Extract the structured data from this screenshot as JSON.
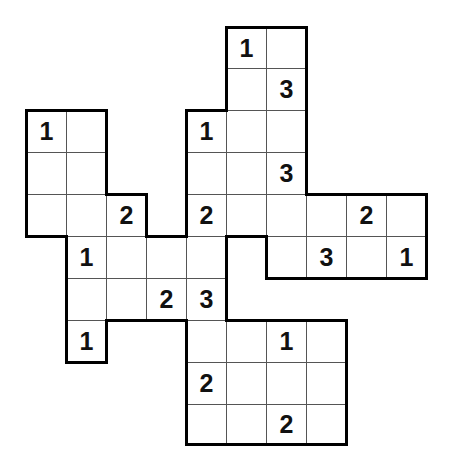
{
  "puzzle": {
    "type": "region-number-grid",
    "grid": {
      "origin_x": 26,
      "col_width": 40,
      "row_tops": [
        27,
        68,
        110,
        152,
        194,
        236,
        278,
        320,
        362,
        404,
        444
      ]
    },
    "cells": [
      {
        "r": 0,
        "c": 5,
        "v": "1"
      },
      {
        "r": 0,
        "c": 6,
        "v": ""
      },
      {
        "r": 1,
        "c": 5,
        "v": ""
      },
      {
        "r": 1,
        "c": 6,
        "v": "3"
      },
      {
        "r": 2,
        "c": 0,
        "v": "1"
      },
      {
        "r": 2,
        "c": 1,
        "v": ""
      },
      {
        "r": 2,
        "c": 4,
        "v": "1"
      },
      {
        "r": 2,
        "c": 5,
        "v": ""
      },
      {
        "r": 2,
        "c": 6,
        "v": ""
      },
      {
        "r": 3,
        "c": 0,
        "v": ""
      },
      {
        "r": 3,
        "c": 1,
        "v": ""
      },
      {
        "r": 3,
        "c": 4,
        "v": ""
      },
      {
        "r": 3,
        "c": 5,
        "v": ""
      },
      {
        "r": 3,
        "c": 6,
        "v": "3"
      },
      {
        "r": 4,
        "c": 0,
        "v": ""
      },
      {
        "r": 4,
        "c": 1,
        "v": ""
      },
      {
        "r": 4,
        "c": 2,
        "v": "2"
      },
      {
        "r": 4,
        "c": 4,
        "v": "2"
      },
      {
        "r": 4,
        "c": 5,
        "v": ""
      },
      {
        "r": 4,
        "c": 6,
        "v": ""
      },
      {
        "r": 4,
        "c": 7,
        "v": ""
      },
      {
        "r": 4,
        "c": 8,
        "v": "2"
      },
      {
        "r": 4,
        "c": 9,
        "v": ""
      },
      {
        "r": 5,
        "c": 1,
        "v": "1"
      },
      {
        "r": 5,
        "c": 2,
        "v": ""
      },
      {
        "r": 5,
        "c": 3,
        "v": ""
      },
      {
        "r": 5,
        "c": 4,
        "v": ""
      },
      {
        "r": 5,
        "c": 6,
        "v": ""
      },
      {
        "r": 5,
        "c": 7,
        "v": "3"
      },
      {
        "r": 5,
        "c": 8,
        "v": ""
      },
      {
        "r": 5,
        "c": 9,
        "v": "1"
      },
      {
        "r": 6,
        "c": 1,
        "v": ""
      },
      {
        "r": 6,
        "c": 2,
        "v": ""
      },
      {
        "r": 6,
        "c": 3,
        "v": "2"
      },
      {
        "r": 6,
        "c": 4,
        "v": "3"
      },
      {
        "r": 7,
        "c": 1,
        "v": "1"
      },
      {
        "r": 7,
        "c": 4,
        "v": ""
      },
      {
        "r": 7,
        "c": 5,
        "v": ""
      },
      {
        "r": 7,
        "c": 6,
        "v": "1"
      },
      {
        "r": 7,
        "c": 7,
        "v": ""
      },
      {
        "r": 8,
        "c": 4,
        "v": "2"
      },
      {
        "r": 8,
        "c": 5,
        "v": ""
      },
      {
        "r": 8,
        "c": 6,
        "v": ""
      },
      {
        "r": 8,
        "c": 7,
        "v": ""
      },
      {
        "r": 9,
        "c": 4,
        "v": ""
      },
      {
        "r": 9,
        "c": 5,
        "v": ""
      },
      {
        "r": 9,
        "c": 6,
        "v": "2"
      },
      {
        "r": 9,
        "c": 7,
        "v": ""
      }
    ],
    "colors": {
      "thick_border": "#000000",
      "thin_line": "#555555",
      "background": "#ffffff",
      "digit": "#111111"
    }
  }
}
